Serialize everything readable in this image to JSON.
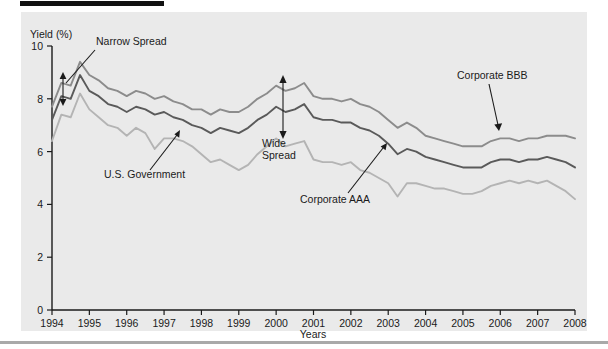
{
  "figure": {
    "title_banner": "",
    "ylabel": "Yield (%)",
    "xlabel": "Years"
  },
  "chart_data": {
    "type": "line",
    "title": "",
    "xlabel": "Years",
    "ylabel": "Yield (%)",
    "xlim": [
      1994,
      2008
    ],
    "ylim": [
      0,
      10
    ],
    "yticks": [
      0,
      2,
      4,
      6,
      8,
      10
    ],
    "ytick_labels": [
      "0",
      "2",
      "4",
      "6",
      "8",
      "10"
    ],
    "xticks": [
      1994,
      1995,
      1996,
      1997,
      1998,
      1999,
      2000,
      2001,
      2002,
      2003,
      2004,
      2005,
      2006,
      2007,
      2008
    ],
    "xtick_labels": [
      "1994",
      "1995",
      "1996",
      "1997",
      "1998",
      "1999",
      "2000",
      "2001",
      "2002",
      "2003",
      "2004",
      "2005",
      "2006",
      "2007",
      "2008"
    ],
    "grid": false,
    "legend": "annotations",
    "colors": {
      "corporate_bbb": "#8c8c8c",
      "corporate_aaa": "#5a5a5a",
      "us_government": "#b4b4b4",
      "panel_background": "#eaeaea",
      "axis": "#1a1a1a",
      "rule": "#a9a9a9"
    },
    "x": [
      1994.0,
      1994.25,
      1994.5,
      1994.75,
      1995.0,
      1995.25,
      1995.5,
      1995.75,
      1996.0,
      1996.25,
      1996.5,
      1996.75,
      1997.0,
      1997.25,
      1997.5,
      1997.75,
      1998.0,
      1998.25,
      1998.5,
      1998.75,
      1999.0,
      1999.25,
      1999.5,
      1999.75,
      2000.0,
      2000.25,
      2000.5,
      2000.75,
      2001.0,
      2001.25,
      2001.5,
      2001.75,
      2002.0,
      2002.25,
      2002.5,
      2002.75,
      2003.0,
      2003.25,
      2003.5,
      2003.75,
      2004.0,
      2004.25,
      2004.5,
      2004.75,
      2005.0,
      2005.25,
      2005.5,
      2005.75,
      2006.0,
      2006.25,
      2006.5,
      2006.75,
      2007.0,
      2007.25,
      2007.5,
      2007.75,
      2008.0
    ],
    "series": [
      {
        "name": "Corporate BBB",
        "color": "#8c8c8c",
        "values": [
          7.7,
          8.6,
          8.5,
          9.4,
          8.9,
          8.7,
          8.4,
          8.3,
          8.1,
          8.3,
          8.2,
          8.0,
          8.1,
          7.9,
          7.8,
          7.6,
          7.6,
          7.4,
          7.6,
          7.5,
          7.5,
          7.7,
          8.0,
          8.2,
          8.5,
          8.3,
          8.4,
          8.6,
          8.1,
          8.0,
          8.0,
          7.9,
          8.0,
          7.8,
          7.7,
          7.5,
          7.2,
          6.9,
          7.1,
          6.9,
          6.6,
          6.5,
          6.4,
          6.3,
          6.2,
          6.2,
          6.2,
          6.4,
          6.5,
          6.5,
          6.4,
          6.5,
          6.5,
          6.6,
          6.6,
          6.6,
          6.5
        ]
      },
      {
        "name": "Corporate AAA",
        "color": "#5a5a5a",
        "values": [
          7.2,
          8.1,
          8.0,
          8.9,
          8.3,
          8.1,
          7.8,
          7.7,
          7.5,
          7.7,
          7.6,
          7.4,
          7.5,
          7.3,
          7.2,
          7.0,
          6.9,
          6.7,
          6.9,
          6.8,
          6.7,
          6.9,
          7.2,
          7.4,
          7.7,
          7.5,
          7.6,
          7.8,
          7.3,
          7.2,
          7.2,
          7.1,
          7.1,
          6.9,
          6.8,
          6.6,
          6.3,
          5.9,
          6.1,
          6.0,
          5.8,
          5.7,
          5.6,
          5.5,
          5.4,
          5.4,
          5.4,
          5.6,
          5.7,
          5.7,
          5.6,
          5.7,
          5.7,
          5.8,
          5.7,
          5.6,
          5.4
        ]
      },
      {
        "name": "U.S. Government",
        "color": "#b4b4b4",
        "values": [
          6.4,
          7.4,
          7.3,
          8.2,
          7.6,
          7.3,
          7.0,
          6.9,
          6.6,
          6.9,
          6.7,
          6.1,
          6.5,
          6.5,
          6.4,
          6.2,
          5.9,
          5.6,
          5.7,
          5.5,
          5.3,
          5.5,
          5.9,
          6.2,
          6.5,
          6.2,
          6.3,
          6.4,
          5.7,
          5.6,
          5.6,
          5.5,
          5.6,
          5.3,
          5.2,
          5.0,
          4.8,
          4.3,
          4.8,
          4.8,
          4.7,
          4.6,
          4.6,
          4.5,
          4.4,
          4.4,
          4.5,
          4.7,
          4.8,
          4.9,
          4.8,
          4.9,
          4.8,
          4.9,
          4.7,
          4.5,
          4.2
        ]
      }
    ],
    "annotations": [
      {
        "label": "Narrow Spread",
        "kind": "arrow-double",
        "target": "spread-1994"
      },
      {
        "label": "Wide Spread",
        "kind": "arrow-double",
        "target": "spread-2000"
      },
      {
        "label": "U.S. Government",
        "kind": "arrow",
        "target": "us-government-line"
      },
      {
        "label": "Corporate AAA",
        "kind": "arrow",
        "target": "corporate-aaa-line"
      },
      {
        "label": "Corporate BBB",
        "kind": "arrow",
        "target": "corporate-bbb-line"
      }
    ]
  }
}
